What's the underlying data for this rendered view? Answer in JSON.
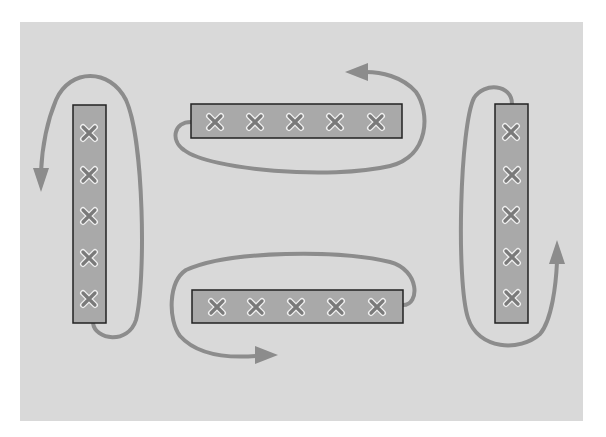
{
  "diagram": {
    "colors": {
      "background": "#d9d9d9",
      "bar_fill": "#a9a9a9",
      "bar_stroke": "#222222",
      "arrow": "#8c8c8c",
      "marker": "#7a7a7a"
    },
    "bars": [
      {
        "id": "left",
        "orientation": "vertical",
        "markers": 5,
        "arrow_direction": "counterclockwise-down-left"
      },
      {
        "id": "top",
        "orientation": "horizontal",
        "markers": 5,
        "arrow_direction": "counterclockwise-up-left"
      },
      {
        "id": "bottom",
        "orientation": "horizontal",
        "markers": 5,
        "arrow_direction": "counterclockwise-down-right"
      },
      {
        "id": "right",
        "orientation": "vertical",
        "markers": 5,
        "arrow_direction": "counterclockwise-up-right"
      }
    ]
  }
}
